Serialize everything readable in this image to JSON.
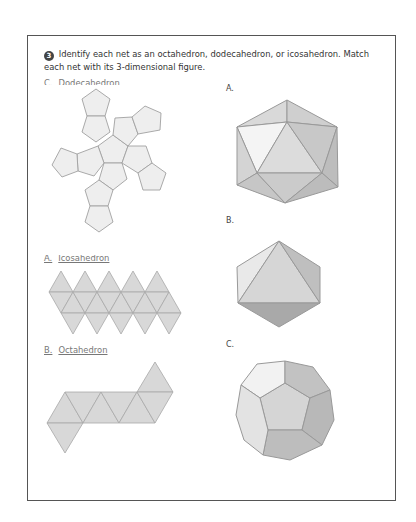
{
  "question": {
    "number": "3",
    "text": "Identify each net as an octahedron, dodecahedron, or icosahedron.  Match each net with its 3-dimensional figure."
  },
  "nets": [
    {
      "letter": "C.",
      "name": "Dodecahedron",
      "shape": "dodecahedron-net"
    },
    {
      "letter": "A.",
      "name": "Icosahedron",
      "shape": "icosahedron-net"
    },
    {
      "letter": "B.",
      "name": "Octahedron",
      "shape": "octahedron-net"
    }
  ],
  "figures": [
    {
      "label": "A.",
      "shape": "icosahedron-3d"
    },
    {
      "label": "B.",
      "shape": "octahedron-3d"
    },
    {
      "label": "C.",
      "shape": "dodecahedron-3d"
    }
  ],
  "colors": {
    "net_fill": "#eeeeee",
    "net_fill_dark": "#d6d6d6",
    "stroke": "#9a9a9a",
    "frame": "#555555"
  }
}
